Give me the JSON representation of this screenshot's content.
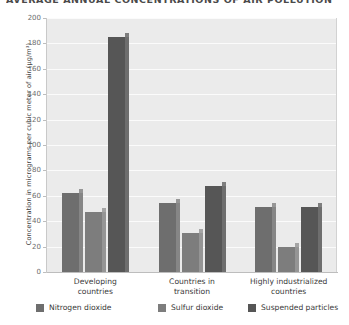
{
  "chart_data": {
    "type": "bar",
    "title": "AVERAGE ANNUAL CONCENTRATIONS OF AIR POLLUTION",
    "xlabel": "",
    "ylabel": "Concentration in micrograms per cubic meter of air (µg/m³)",
    "ylim": [
      0,
      200
    ],
    "ytick_step": 20,
    "yticks": [
      "0",
      "20",
      "40",
      "60",
      "80",
      "100",
      "120",
      "140",
      "160",
      "180",
      "200"
    ],
    "grid": true,
    "legend_position": "bottom",
    "categories": [
      "Developing countries",
      "Countries in transition",
      "Highly industrialized countries"
    ],
    "categories_lines": [
      [
        "Developing",
        "countries"
      ],
      [
        "Countries in",
        "transition"
      ],
      [
        "Highly industrialized",
        "countries"
      ]
    ],
    "series": [
      {
        "name": "Nitrogen dioxide",
        "color": "#6e6e6e",
        "values": [
          62,
          54,
          51
        ]
      },
      {
        "name": "Sulfur dioxide",
        "color": "#7d7d7d",
        "values": [
          47,
          31,
          20
        ]
      },
      {
        "name": "Suspended particles",
        "color": "#565656",
        "values": [
          185,
          68,
          51
        ]
      }
    ]
  },
  "style": {
    "plot_background": "#ebebeb",
    "gridline_color": "#fbfbfb",
    "axis_color": "#bdbdbd",
    "text_color": "#3a3a3a",
    "tick_text_color": "#6d6d6d"
  }
}
